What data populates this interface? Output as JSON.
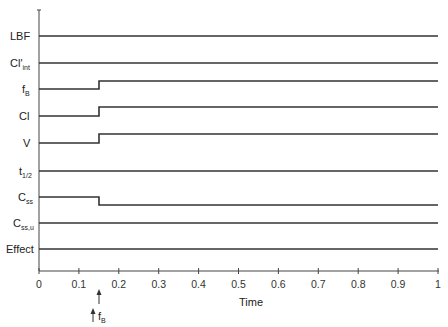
{
  "chart_data": {
    "type": "line",
    "title": "",
    "xlabel": "Time",
    "ylabel": "",
    "xlim": [
      0,
      1
    ],
    "x_ticks": [
      "0",
      "0.1",
      "0.2",
      "0.3",
      "0.4",
      "0.5",
      "0.6",
      "0.7",
      "0.8",
      "0.9",
      "1"
    ],
    "grid": false,
    "event": {
      "x": 0.15,
      "label": "f",
      "label_sub": "B"
    },
    "series": [
      {
        "name": "LBF",
        "sub": "",
        "change_at": null,
        "before": "constant",
        "after": "constant"
      },
      {
        "name": "Cl'",
        "sub": "int",
        "change_at": null,
        "before": "constant",
        "after": "constant"
      },
      {
        "name": "f",
        "sub": "B",
        "change_at": 0.15,
        "before": "baseline",
        "after": "increase"
      },
      {
        "name": "Cl",
        "sub": "",
        "change_at": 0.15,
        "before": "baseline",
        "after": "increase"
      },
      {
        "name": "V",
        "sub": "",
        "change_at": 0.15,
        "before": "baseline",
        "after": "increase"
      },
      {
        "name": "t",
        "sub": "1/2",
        "change_at": null,
        "before": "constant",
        "after": "constant"
      },
      {
        "name": "C",
        "sub": "ss",
        "change_at": 0.15,
        "before": "baseline",
        "after": "decrease"
      },
      {
        "name": "C",
        "sub": "ss,u",
        "change_at": null,
        "before": "constant",
        "after": "constant"
      },
      {
        "name": "Effect",
        "sub": "",
        "change_at": null,
        "before": "constant",
        "after": "constant"
      }
    ]
  }
}
